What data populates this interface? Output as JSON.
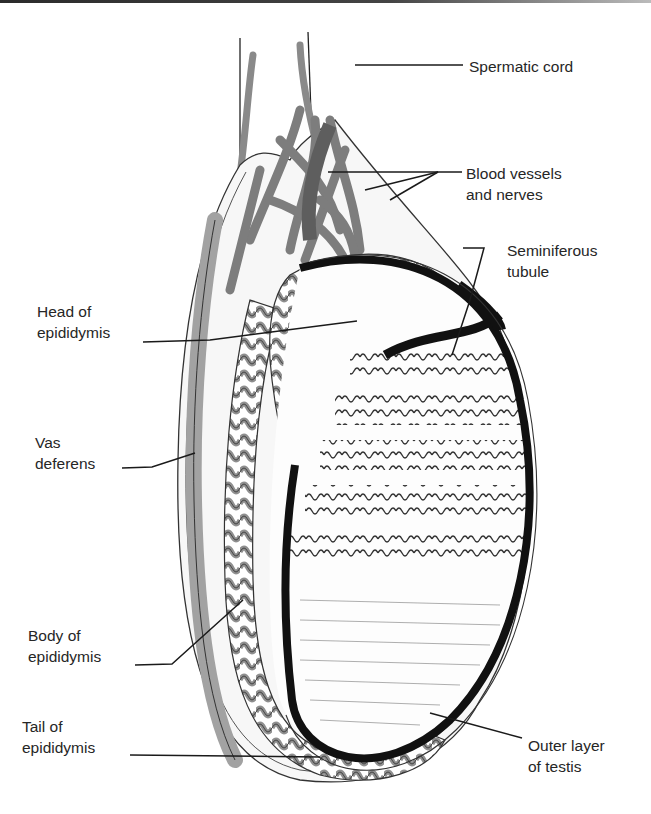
{
  "diagram": {
    "type": "anatomical-illustration",
    "colors": {
      "tubule_fill": "#a7a7a7",
      "vessel_fill": "#8e8e8e",
      "outline": "#1c1c1c",
      "tunica": "#111111",
      "background": "#ffffff"
    },
    "labels": {
      "spermatic_cord": "Spermatic cord",
      "blood_vessels": "Blood vessels\nand nerves",
      "seminiferous_tubule": "Seminiferous\ntubule",
      "head_of_epididymis": "Head of\nepididymis",
      "vas_deferens": "Vas\ndeferens",
      "body_of_epididymis": "Body of\nepididymis",
      "tail_of_epididymis": "Tail of\nepididymis",
      "outer_layer": "Outer layer\nof testis"
    }
  }
}
